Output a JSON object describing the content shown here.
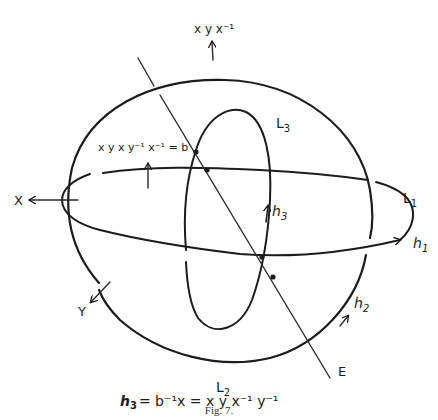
{
  "figure": {
    "caption": "Fig. 7.",
    "equation": {
      "lhs": "h",
      "lhs_sub": "3",
      "rhs": "= b⁻¹x = x y x⁻¹ y⁻¹"
    }
  },
  "labels": {
    "top_generator": "x y x⁻¹",
    "b_relation": "x y x y⁻¹ x⁻¹ = b",
    "x_axis": "X",
    "y_axis": "Y",
    "L1": {
      "main": "L",
      "sub": "1"
    },
    "L2": {
      "main": "L",
      "sub": "2"
    },
    "L3": {
      "main": "L",
      "sub": "3"
    },
    "h1": {
      "main": "h",
      "sub": "1"
    },
    "h2": {
      "main": "h",
      "sub": "2"
    },
    "h3": {
      "main": "h",
      "sub": "3"
    },
    "E": "E"
  },
  "colors": {
    "ink": "#1c1c1c",
    "caption": "#333333",
    "background": "#ffffff"
  }
}
